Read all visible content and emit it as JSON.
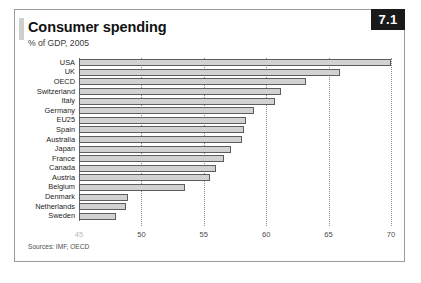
{
  "figure": {
    "number_badge": "7.1",
    "title": "Consumer spending",
    "subtitle": "% of GDP, 2005",
    "sources": "Sources: IMF, OECD"
  },
  "colors": {
    "bar_fill": "#d2d2d2",
    "bar_outline": "#5d5d5d",
    "badge_background": "#1a1a1a",
    "badge_text": "#ffffff",
    "gridline": "#8d8d8d",
    "frame": "#9a9a9a"
  },
  "chart_data": {
    "type": "bar",
    "orientation": "horizontal",
    "title": "Consumer spending",
    "subtitle": "% of GDP, 2005",
    "xlabel": "",
    "ylabel": "",
    "xlim": [
      45,
      70
    ],
    "grid": true,
    "legend": false,
    "xticks": [
      45,
      50,
      55,
      60,
      65,
      70
    ],
    "xtick_labels": [
      "45",
      "50",
      "55",
      "60",
      "65",
      "70"
    ],
    "categories": [
      "USA",
      "UK",
      "OECD",
      "Switzerland",
      "Italy",
      "Germany",
      "EU25",
      "Spain",
      "Australia",
      "Japan",
      "France",
      "Canada",
      "Austria",
      "Belgium",
      "Denmark",
      "Netherlands",
      "Sweden"
    ],
    "values": [
      70.0,
      65.9,
      63.2,
      61.2,
      60.7,
      59.0,
      58.4,
      58.2,
      58.1,
      57.2,
      56.6,
      56.0,
      55.5,
      53.5,
      48.9,
      48.8,
      48.0
    ],
    "value_unit": "% of GDP"
  }
}
